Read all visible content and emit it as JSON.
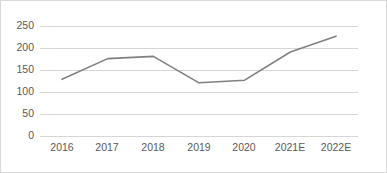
{
  "chart_data": {
    "type": "line",
    "title": "",
    "subtitle": "",
    "xlabel": "",
    "ylabel": "",
    "categories": [
      "2016",
      "2017",
      "2018",
      "2019",
      "2020",
      "2021E",
      "2022E"
    ],
    "values": [
      130,
      177,
      182,
      122,
      128,
      192,
      228
    ],
    "series": [
      {
        "name": "",
        "values": [
          130,
          177,
          182,
          122,
          128,
          192,
          228
        ]
      }
    ],
    "ylim": [
      0,
      250
    ],
    "y_ticks": [
      0,
      50,
      100,
      150,
      200,
      250
    ],
    "y_tick_labels": [
      "0",
      "50",
      "100",
      "150",
      "200",
      "250"
    ],
    "x_tick_labels": [
      "2016",
      "2017",
      "2018",
      "2019",
      "2020",
      "2021E",
      "2022E"
    ],
    "grid": "horizontal",
    "legend": "none",
    "annotations": [],
    "colors": {
      "line": "#808080",
      "grid": "#d6d6d6",
      "border": "#d9d9d9",
      "background": "#ffffff",
      "tick_label": "#595959"
    }
  }
}
